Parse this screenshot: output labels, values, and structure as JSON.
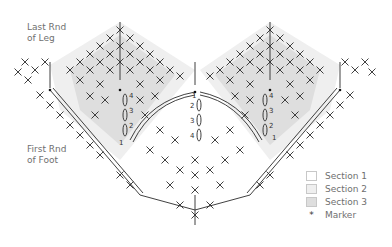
{
  "labels": {
    "top_left": [
      "Last Rnd",
      "of Leg"
    ],
    "bottom_left": [
      "First Rnd",
      "of Foot"
    ]
  },
  "legend": {
    "items": [
      {
        "label": "Section 1",
        "color": "#ffffff"
      },
      {
        "label": "Section 2",
        "color": "#efefef"
      },
      {
        "label": "Section 3",
        "color": "#dedede"
      }
    ],
    "marker": {
      "symbol": "*",
      "label": "Marker"
    }
  },
  "diagram": {
    "stitch_color": "#2b2b2b",
    "row_numbers_left": [
      "4",
      "3",
      "2",
      "1"
    ],
    "row_numbers_center": [
      "1",
      "2",
      "3",
      "4"
    ],
    "row_numbers_right": [
      "4",
      "3",
      "2",
      "1"
    ]
  }
}
